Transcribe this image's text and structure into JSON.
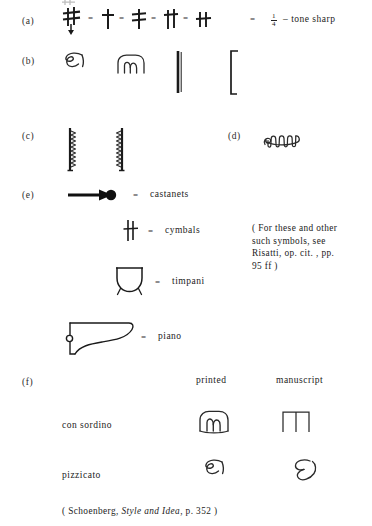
{
  "figure": {
    "rows": [
      {
        "key": "a",
        "label": "(a)",
        "symbols": [
          "quarter-tone-sharp-variant-1",
          "quarter-tone-sharp-variant-2",
          "quarter-tone-sharp-variant-3",
          "quarter-tone-sharp-variant-4",
          "quarter-tone-sharp-variant-5"
        ],
        "separator": "=",
        "result_prefix": "=",
        "fraction_numerator": "1",
        "fraction_denominator": "4",
        "result_text": "– tone sharp"
      },
      {
        "key": "b",
        "label": "(b)",
        "symbols": [
          "pizzicato-manuscript-curl",
          "con-sordino-printed-arc",
          "thick-vertical-bar",
          "open-bracket"
        ]
      },
      {
        "key": "c",
        "label": "(c)",
        "symbols": [
          "zigzag-bar-left",
          "zigzag-bar-right"
        ]
      },
      {
        "key": "d",
        "label": "(d)",
        "symbols": [
          "wavy-mute-squiggle"
        ]
      },
      {
        "key": "e",
        "label": "(e)",
        "items": [
          {
            "symbol": "castanets-glyph",
            "equals": "=",
            "name": "castanets"
          },
          {
            "symbol": "cymbals-glyph",
            "equals": "=",
            "name": "cymbals"
          },
          {
            "symbol": "timpani-glyph",
            "equals": "=",
            "name": "timpani"
          },
          {
            "symbol": "piano-glyph",
            "equals": "=",
            "name": "piano"
          }
        ],
        "aside": "( For these and other\nsuch symbols, see\nRisatti, op. cit. , pp.\n95 ff )"
      },
      {
        "key": "f",
        "label": "(f)",
        "columns": [
          "printed",
          "manuscript"
        ],
        "rows": [
          {
            "term": "con sordino",
            "printed": "con-sordino-printed-arc",
            "manuscript": "con-sordino-manuscript-bracket"
          },
          {
            "term": "pizzicato",
            "printed": "pizzicato-printed-curl",
            "manuscript": "pizzicato-manuscript-epsilon"
          }
        ]
      }
    ],
    "citation": {
      "open": "( Schoenberg, ",
      "italic_title": "Style and Idea",
      "close": ", p. 352 )"
    }
  },
  "colors": {
    "ink": "#1a1a1a",
    "paper": "#ffffff",
    "faint": "#555555"
  }
}
